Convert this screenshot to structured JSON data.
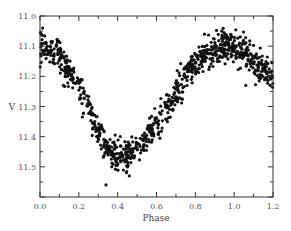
{
  "chart_data": {
    "type": "scatter",
    "title": "",
    "xlabel": "Phase",
    "ylabel": "V",
    "xlim": [
      0.0,
      1.2
    ],
    "ylim": [
      11.6,
      11.0
    ],
    "y_inverted": true,
    "x_ticks": [
      "0.0",
      "0.2",
      "0.4",
      "0.6",
      "0.8",
      "1.0",
      "1.2"
    ],
    "y_ticks": [
      "11.0",
      "11.1",
      "11.2",
      "11.3",
      "11.4",
      "11.5"
    ],
    "grid": false,
    "legend": null,
    "marker_color": "#111111",
    "series": [
      {
        "name": "light curve (phased)",
        "trend_points": [
          {
            "x": 0.0,
            "y": 11.1
          },
          {
            "x": 0.05,
            "y": 11.11
          },
          {
            "x": 0.1,
            "y": 11.13
          },
          {
            "x": 0.15,
            "y": 11.18
          },
          {
            "x": 0.2,
            "y": 11.23
          },
          {
            "x": 0.25,
            "y": 11.3
          },
          {
            "x": 0.3,
            "y": 11.38
          },
          {
            "x": 0.35,
            "y": 11.44
          },
          {
            "x": 0.4,
            "y": 11.46
          },
          {
            "x": 0.45,
            "y": 11.46
          },
          {
            "x": 0.5,
            "y": 11.43
          },
          {
            "x": 0.55,
            "y": 11.4
          },
          {
            "x": 0.6,
            "y": 11.36
          },
          {
            "x": 0.65,
            "y": 11.31
          },
          {
            "x": 0.7,
            "y": 11.26
          },
          {
            "x": 0.75,
            "y": 11.2
          },
          {
            "x": 0.8,
            "y": 11.16
          },
          {
            "x": 0.85,
            "y": 11.13
          },
          {
            "x": 0.9,
            "y": 11.11
          },
          {
            "x": 0.95,
            "y": 11.1
          },
          {
            "x": 1.0,
            "y": 11.1
          },
          {
            "x": 1.05,
            "y": 11.12
          },
          {
            "x": 1.1,
            "y": 11.15
          },
          {
            "x": 1.15,
            "y": 11.18
          },
          {
            "x": 1.2,
            "y": 11.21
          }
        ],
        "scatter_sigma": 0.025,
        "outliers": [
          {
            "x": 0.12,
            "y": 11.23
          },
          {
            "x": 0.34,
            "y": 11.56
          },
          {
            "x": 0.46,
            "y": 11.53
          },
          {
            "x": 0.37,
            "y": 11.5
          },
          {
            "x": 0.13,
            "y": 11.2
          },
          {
            "x": 1.06,
            "y": 11.23
          }
        ]
      }
    ]
  }
}
